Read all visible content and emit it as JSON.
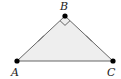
{
  "diagram": {
    "type": "right isosceles triangle",
    "fill_color": "#eeeeee",
    "stroke_color": "#666666",
    "vertex_color": "#000000",
    "vertices": [
      {
        "label": "A",
        "x": 17,
        "y": 61
      },
      {
        "label": "B",
        "x": 65,
        "y": 16
      },
      {
        "label": "C",
        "x": 113,
        "y": 61
      }
    ],
    "right_angle_at": "B",
    "congruent_sides": [
      "AB",
      "BC"
    ]
  }
}
